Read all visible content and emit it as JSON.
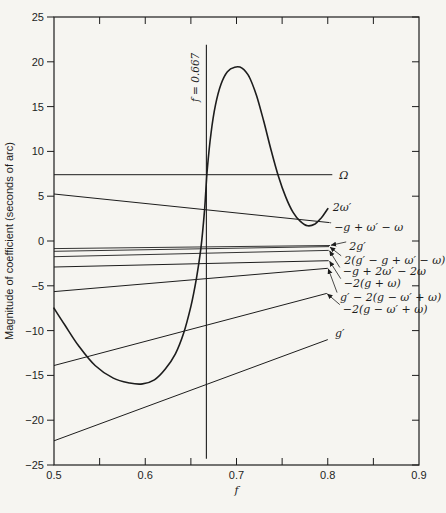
{
  "figure": {
    "width": 446,
    "height": 513,
    "background": "#f6f5f1",
    "ink": "#1d1d1d"
  },
  "chart_data": {
    "type": "line",
    "title": "",
    "xlabel": "f",
    "ylabel": "Magnitude of coefficient (seconds of arc)",
    "xlim": [
      0.5,
      0.9
    ],
    "ylim": [
      -25,
      25
    ],
    "grid": false,
    "x_major_ticks": [
      0.5,
      0.6,
      0.7,
      0.8,
      0.9
    ],
    "x_major_tick_labels": [
      "0.5",
      "0.6",
      "0.7",
      "0.8",
      "0.9"
    ],
    "x_minor_ticks": [
      0.55,
      0.65,
      0.75,
      0.85
    ],
    "y_ticks": [
      -25,
      -20,
      -15,
      -10,
      -5,
      0,
      5,
      10,
      15,
      20,
      25
    ],
    "y_tick_labels": [
      "−25",
      "−20",
      "−15",
      "−10",
      "−5",
      "0",
      "5",
      "10",
      "15",
      "20",
      "25"
    ],
    "reference_line": {
      "x": 0.667,
      "label": "f = 0.667",
      "v_from": -24.3,
      "v_to": 21.9
    },
    "series": [
      {
        "name": "Ω",
        "slug": "omega",
        "shape": "line",
        "width": 1.0,
        "points": [
          [
            0.5,
            7.4
          ],
          [
            0.805,
            7.4
          ]
        ]
      },
      {
        "name": "−g + ω′ − ω",
        "slug": "neg-g-plus-wp-minus-w",
        "shape": "line",
        "width": 1.0,
        "points": [
          [
            0.5,
            5.25
          ],
          [
            0.802,
            2.05
          ]
        ]
      },
      {
        "name": "2ω′",
        "slug": "two-wp-resonant-curve",
        "shape": "curve",
        "width": 1.6,
        "points": [
          [
            0.5,
            -7.5
          ],
          [
            0.512,
            -9.4
          ],
          [
            0.527,
            -11.7
          ],
          [
            0.545,
            -13.9
          ],
          [
            0.565,
            -15.3
          ],
          [
            0.583,
            -15.85
          ],
          [
            0.597,
            -15.95
          ],
          [
            0.61,
            -15.5
          ],
          [
            0.622,
            -14.3
          ],
          [
            0.633,
            -12.6
          ],
          [
            0.642,
            -10.3
          ],
          [
            0.65,
            -7.3
          ],
          [
            0.656,
            -4.2
          ],
          [
            0.661,
            -0.8
          ],
          [
            0.665,
            3.5
          ],
          [
            0.668,
            8.0
          ],
          [
            0.672,
            12.0
          ],
          [
            0.677,
            15.2
          ],
          [
            0.683,
            17.5
          ],
          [
            0.69,
            18.9
          ],
          [
            0.698,
            19.4
          ],
          [
            0.706,
            19.3
          ],
          [
            0.714,
            18.3
          ],
          [
            0.722,
            16.2
          ],
          [
            0.73,
            13.3
          ],
          [
            0.738,
            10.1
          ],
          [
            0.746,
            7.2
          ],
          [
            0.754,
            4.9
          ],
          [
            0.762,
            3.2
          ],
          [
            0.77,
            2.2
          ],
          [
            0.778,
            1.7
          ],
          [
            0.786,
            1.9
          ],
          [
            0.793,
            2.6
          ],
          [
            0.8,
            3.6
          ]
        ]
      },
      {
        "name": "2g′",
        "slug": "two-gp",
        "shape": "line",
        "width": 0.9,
        "points": [
          [
            0.5,
            -0.85
          ],
          [
            0.8025,
            -0.5
          ]
        ]
      },
      {
        "name": "2(g′ − g + ω′ − ω)",
        "slug": "two-gp-minus-g-plus-wp-minus-w",
        "shape": "line",
        "width": 0.9,
        "points": [
          [
            0.5,
            -1.15
          ],
          [
            0.8015,
            -0.62
          ]
        ]
      },
      {
        "name": "−g + 2ω′ − 2ω",
        "slug": "neg-g-plus-2wp-minus-2w",
        "shape": "line",
        "width": 0.9,
        "points": [
          [
            0.5,
            -1.75
          ],
          [
            0.801,
            -1.05
          ]
        ]
      },
      {
        "name": "−2(g + ω)",
        "slug": "neg-2-g-plus-w",
        "shape": "line",
        "width": 1.0,
        "points": [
          [
            0.5,
            -2.9
          ],
          [
            0.801,
            -2.2
          ]
        ]
      },
      {
        "name": "g′ − 2(g − ω′ + ω)",
        "slug": "gp-minus-2-g-minus-wp-plus-w",
        "shape": "line",
        "width": 1.0,
        "points": [
          [
            0.5,
            -5.65
          ],
          [
            0.8,
            -3.05
          ]
        ]
      },
      {
        "name": "−2(g − ω′ + ω)",
        "slug": "neg-2-g-minus-wp-plus-w",
        "shape": "line",
        "width": 1.0,
        "points": [
          [
            0.5,
            -13.9
          ],
          [
            0.799,
            -5.85
          ]
        ]
      },
      {
        "name": "g′",
        "slug": "gp",
        "shape": "line",
        "width": 1.0,
        "points": [
          [
            0.5,
            -22.3
          ],
          [
            0.8,
            -11.0
          ]
        ]
      }
    ],
    "annotations": [
      {
        "text": "Ω",
        "slug": "omega-label",
        "f": 0.8125,
        "v": 7.4
      },
      {
        "text": "2ω′",
        "slug": "two-wp-label",
        "f": 0.8055,
        "v": 3.85
      },
      {
        "text": "−g + ω′ − ω",
        "slug": "neg-g-plus-wp-minus-w-label",
        "f": 0.807,
        "v": 1.6,
        "leader": {
          "f": 0.8025,
          "v": 2.02
        },
        "arrow": false
      },
      {
        "text": "2g′",
        "slug": "two-gp-label",
        "f": 0.8235,
        "v": -0.55,
        "leader": {
          "f": 0.8035,
          "v": -0.48
        },
        "arrow": true
      },
      {
        "text": "2(g′ − g + ω′ − ω)",
        "slug": "two-gp-minus-g-plus-wp-minus-w-label",
        "f": 0.818,
        "v": -2.1,
        "leader": {
          "f": 0.8025,
          "v": -0.68
        },
        "arrow": true
      },
      {
        "text": "−g + 2ω′ − 2ω",
        "slug": "neg-g-plus-2wp-minus-2w-label",
        "f": 0.8165,
        "v": -3.4,
        "leader": {
          "f": 0.802,
          "v": -1.1
        },
        "arrow": true
      },
      {
        "text": "−2(g + ω)",
        "slug": "neg-2-g-plus-w-label",
        "f": 0.8175,
        "v": -4.65,
        "leader": {
          "f": 0.802,
          "v": -2.25
        },
        "arrow": true
      },
      {
        "text": "g′ − 2(g − ω′ + ω)",
        "slug": "gp-minus-2-g-minus-wp-plus-w-label",
        "f": 0.8135,
        "v": -6.2,
        "leader": {
          "f": 0.8005,
          "v": -3.1
        },
        "arrow": true
      },
      {
        "text": "−2(g − ω′ + ω)",
        "slug": "neg-2-g-minus-wp-plus-w-label",
        "f": 0.8165,
        "v": -7.55,
        "leader": {
          "f": 0.7995,
          "v": -5.9
        },
        "arrow": true
      },
      {
        "text": "g′",
        "slug": "gp-label",
        "f": 0.808,
        "v": -10.3
      }
    ]
  },
  "plot_box": {
    "x_left_px": 54,
    "x_right_px": 419,
    "y_top_px": 17,
    "y_bottom_px": 465
  }
}
